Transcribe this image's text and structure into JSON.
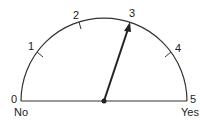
{
  "gauge": {
    "min": 0,
    "max": 5,
    "value": 3,
    "ticks": [
      "0",
      "1",
      "2",
      "3",
      "4",
      "5"
    ],
    "left_label": "No",
    "right_label": "Yes",
    "colors": {
      "stroke": "#333333",
      "needle": "#222222",
      "background": "#ffffff"
    }
  }
}
